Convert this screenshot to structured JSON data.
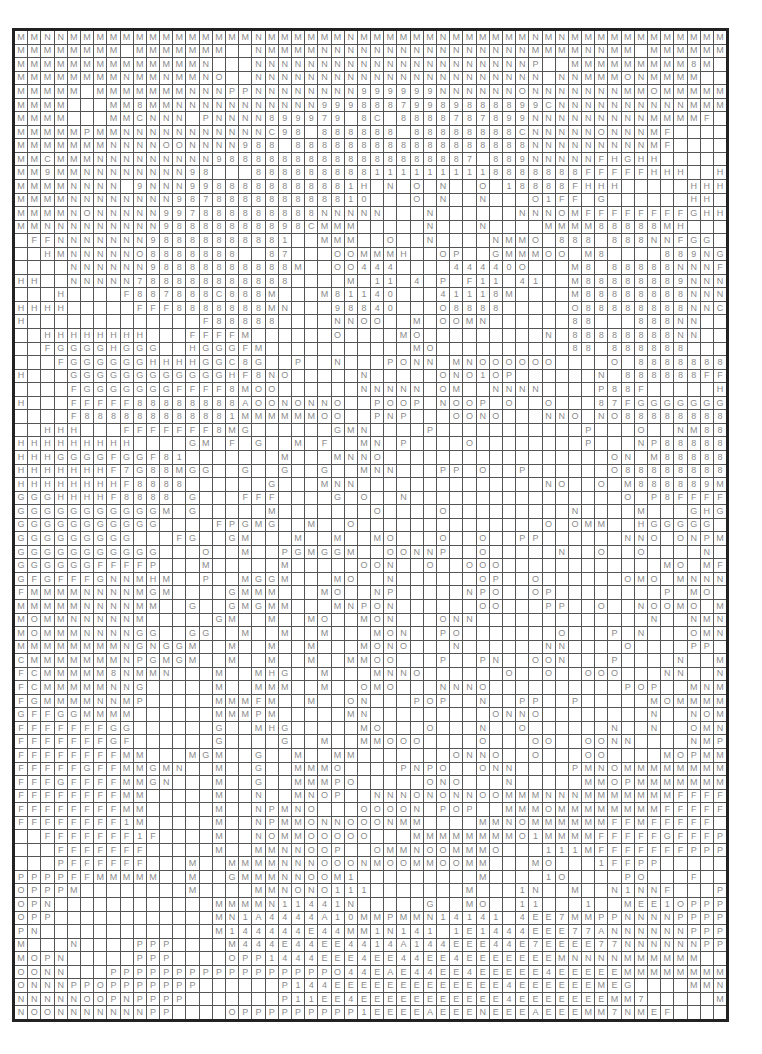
{
  "grid": {
    "columns": 54,
    "rows": [
      "MMNNMMMMMMMMMMMMMMNMMMMMMNMMMMMMNMMMMMMNMNMMMMMMMMMMMM",
      "MMMMMMMM MMMMMMM  NMMMMNNNNNNNNNNNNNNNNMMMMNNMM MMMMMM8M",
      "MMMMMMMMMMMMMMN   NNNNNNNNNNNNNNNNNNNNNP  MMMMMMMMM8M",
      "MMMMMMMMNMMNMMNO  NNNNNNNNNNNNNNNNNNNNNN NNMMMONMMMM",
      "MMMMM MMMMMMMNNNPPNNNNNNNN999999NNNNNNONNNNNNNMMOMMMMM",
      "MMMM   MM8MMNNNNNNNNNNN99988879989888899CNNNNNNNNNNMMMMMM",
      "MMMM   MMCNNN PNNNN899979 8C 8888787899NNNNNNNNNMMMMF ",
      "MMMMMPMMNNNNNNNNNNNC98 888888 88888888CNNNNNONNNMF ",
      "MMMMMMMNNNNOONNNN988 888888888888888888NNNNNNNNNMF ",
      "MMCMMMNNNNNNNNN98888888888888888887 889NNNNNFHGHH",
      "MM9MMNNNNNNNN98   8888888881111111118888888FFFFFHHH  H",
      "MMMMNNNN 9NNN9988888888881H N O N  O 18888FHHH     HHH",
      "MMMMNNNNNNNN987888888888810   O N  N   O1FF G      HH",
      "MMMMNONNNNN997888888888NNNNN   N      NNNOMFFFFFFFFGHH",
      "MMNNNNNNNNN98888888898CMMM     N   N    MMMM88888MH  ",
      " FFNNNNNNN98888888881  MMM  O  N    NMMO 888 888NNFGG",
      "  HMNNNNNO8888888  87   OOMMMH  OP  GMMMOO M8    889NGGG",
      "    NNNNNN98888888888M  OO444    44440O   M8 88888NNNF",
      "HH  NNNNN788888888888    M 11 4 P F11 41  M88888889NNN",
      "   H    F887888C888M   M81140   41118M    M88888888NNN",
      "HHHH     FFF8888888MN   98840   O8888     O88888888NNC",
      "H             F88888    NNOO  M OOMN      88   888NN",
      "  HHHHHHHH   FFFFM      O    MO         N 88888888NN",
      "  FGGGGHGGG  HGGGFM           MO          88 888888  ",
      "   FGGGGGGHHHHGGC8G  P  N   PONN MNOOOOOO    O 88888888G P",
      "H   GGGGGGGGGGGGHF8NO     N     ONO1OP      N 888888FF  H",
      "    FGGGGGGGFFFF8MOO      NNNNN OM  NNNN    P88F     HH",
      "H   FFFFF88888888AOONONNO  POOP NOOP O  O   87FGGGGGGG",
      "    F888888888881MMMMMMOO  PNP   OONO   NNO NO888888888FGG",
      "  HHH   FFFFFFF8MG      GMN    P           P   O  NM88878898F",
      "HHHHHHHHH    GM F G  M F  MN P    O        P   NP888888889N",
      "HHHGGGGFGGF81       M   MNNO                 ON M88888889NN",
      "HHHHHHHF7G88MGG  G  G  G  MNN   PP O  P      O88888888NF",
      "HHHHHHHHF8888      G   MNN              NO  O M888889MH",
      "GGGHHHHF8888 G   FFF    G O  N                O P8FFFFFHH",
      "GGGGGGGGGGGM G     M       O    O         N    M   GHGH",
      "GGGGGGGGGGG    FPGMG  M  O              O OMM  HGGGGG",
      "GGGGGGGGG   FG  GM   M  M  MO   O  O  PP      NNO ONPMGGGGGG",
      "GGGGGGGGGGG   O  M  PGMGGM  OONNP  O     N  O  O    N MGGGGG",
      "GGGGGGFFFFP   M     M     OON  O  OOO            MO MFFFFGG",
      "GFGFFFGNNMHM  P  MGGM   MO  N      OP  O      OMO MNNNNMG",
      "FMMMMNNNNMGM    GMMM   MO  NP     NPO  OP        P MO MNNNNMM",
      "MMMMMNNNNMM  G  GMGMM   MNPON      OO   PP  O  NOOMO MNMNNM",
      "MOMMNNNNNM     GM  M  MO  MON   ONN             N  NMNPMNNNNNM",
      "MOMMMNNNNGG  GG  M  M  M   MON  PO       O   P N   OMN1NNNNNM",
      "MMMMMMMMNGNGGM  M  M  M   MONO   N      NN    O    PP    MNNNNNNN M",
      "CMMMMMMMNPGMGM  M  M  M  MMOO   P  PN  OON   P    N  MM  NNONNN M",
      "FCMMMMM8NMMN   M  MHG  M   MNNO      O  O  OOO   NN  NMM1MNNNN MM",
      "FCMMMMMNNG     M  MMM  M  OMO   NNNO          POP  MNM1MMMNMMMG",
      "FGMMMMNNMP     MMMFM  M  ON   POP  N  PP  P     MOMMMMMMMMMG",
      "GFFGGMMMM      MMMPM     MN         ONNO        N  NOMMNMNMMMFF",
      "FFFFFFFGG      G  MHG     MO   O   N  O      N  N  OMN1MMMMMMMFFF",
      "FFFFFFFGF      G    G  M  MMOOO    O   OO  OONN    NMPMMMMMNMFFF",
      "FFFFFFFFMM   MGM  G  M  MM       ONNO  O   OO    MOPMMNMMMMMFFF",
      "FFFFFGFFMMGMN  M  G  MMMO    PNPO  ONN    PMNOMMMMMMMMMFFF",
      "FFFGFFFFMMGN   M  G  MMMPO     ONO   N     MMOPMMMMMMMFFFFFF",
      "FFFFFFFFMM     M  N  MNOP  NNNONONNOOMMMNNNMMMMMMMFFFFFFF ",
      "FFFFFFFFMM     M  NPMNO   OOOON POP  MMMOMMMMMMMMFFFFFFH  ",
      "FFFFFFFF1M     M  NPMMONNOOONMM    MMNOMMMMMMFFMFFFFF    ",
      "  FFFFFFF1F    M  NOMMOOOOO   MMMMMMMMO1MMMMFFFFFGFFFP    ",
      "   FFFFFFF     M  MMNNOOP  OMMNOOMMMO   111MFFFFFFFPPPPPP",
      "   PFFFFFF   M  MMMMNNNOOONMOOMMOOMM   MO   1FFPP      PPP",
      "PPPPFFMMMMM  M  GMMMNNOOM1         M    1O    PO   F   PPPP    PP",
      "OPPPM        M    MMNONO111       M   1N  M  N1NNF   PPPPPPPPPPP",
      "OPN            MMMMN11441N     G  MO  11   1  MEE1OPPPPPPPPPPPPP",
      "OPP            MN1A4444A10MMPMMN14141 4EE7MMPPNNNNPPPPP",
      "PN             M144444E44MM1N141 1E1444EEE77ANNNNNNPPPO",
      "M   N    PPP    M444E44EE4414A144EEE44E7EEEE77NNNNNNPPN",
      "MOPN     PPP    OPP1444EEE4EE44EE4EEEEEEEMNNNNMMMMMM",
      "OONN   PPPPPPPPPPPPPPPPPO44EAE44EE4EEEEE4EEEEEMMMMMMMMN",
      "ONNNPPOPPPPPPP      P144EEEEEEEEEEEEE4EEEEEEMEG    MMN",
      "NNNNNOOPNPPPP       P11EE4EEEEEEEEEEE4EEEEEEEMM7     M",
      "NOONNNNNNNPP    OPPPPPPPPP1EEEEAEEENEEEAEEEMM7NMEF    "
    ]
  }
}
